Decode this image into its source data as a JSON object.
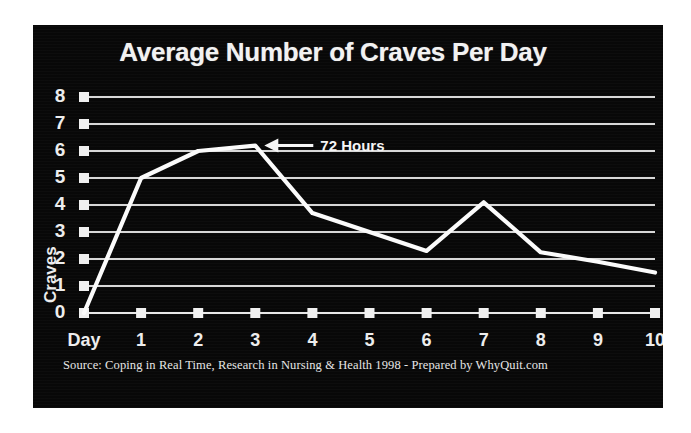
{
  "figure": {
    "panel_background": "#080808",
    "page_background": "#ffffff",
    "ink_color": "#fbfbfb",
    "grid_color": "#d8d8d8"
  },
  "title": "Average Number of Craves Per Day",
  "y_axis_title": "Craves",
  "x_axis_first_label": "Day",
  "annotation": {
    "label": "72 Hours",
    "icon": "left-arrow-icon"
  },
  "source_note": "Source:  Coping in Real Time, Research in Nursing & Health 1998 - Prepared by WhyQuit.com",
  "chart_data": {
    "type": "line",
    "title": "Average Number of Craves Per Day",
    "xlabel": "Day",
    "ylabel": "Craves",
    "x": [
      0,
      1,
      2,
      3,
      4,
      5,
      6,
      7,
      8,
      9,
      10
    ],
    "categories": [
      "Day",
      "1",
      "2",
      "3",
      "4",
      "5",
      "6",
      "7",
      "8",
      "9",
      "10"
    ],
    "values": [
      0,
      5.0,
      6.0,
      6.2,
      3.7,
      3.0,
      2.3,
      4.1,
      2.25,
      1.9,
      1.5
    ],
    "series": [
      {
        "name": "Average craves per day",
        "values": [
          0,
          5.0,
          6.0,
          6.2,
          3.7,
          3.0,
          2.3,
          4.1,
          2.25,
          1.9,
          1.5
        ]
      }
    ],
    "xlim": [
      0,
      10
    ],
    "ylim": [
      0,
      8
    ],
    "ytick_labels": [
      "8",
      "7",
      "6",
      "5",
      "4",
      "3",
      "2",
      "1",
      "0"
    ],
    "yticks": [
      8,
      7,
      6,
      5,
      4,
      3,
      2,
      1,
      0
    ],
    "xtick_labels": [
      "Day",
      "1",
      "2",
      "3",
      "4",
      "5",
      "6",
      "7",
      "8",
      "9",
      "10"
    ],
    "grid": true,
    "grid_axis": "y",
    "legend": false,
    "annotations": [
      {
        "text": "72 Hours",
        "points_to_x": 3,
        "points_to_y": 6.2
      }
    ]
  }
}
